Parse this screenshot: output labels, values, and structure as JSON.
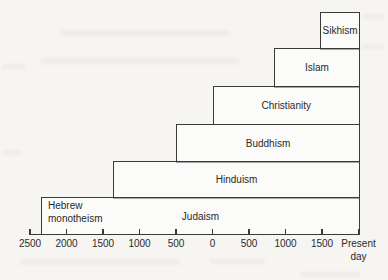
{
  "chart_data": {
    "type": "bar",
    "subtype": "staircase-timeline",
    "title": "",
    "xlabel": "",
    "ylabel": "",
    "x_axis": {
      "range_years": [
        -2500,
        2000
      ],
      "note": "negative years = BCE; axis numbers shown without era labels; right end marked Present day",
      "ticks": [
        {
          "year": -2500,
          "label": "2500"
        },
        {
          "year": -2000,
          "label": "2000"
        },
        {
          "year": -1500,
          "label": "1500"
        },
        {
          "year": -1000,
          "label": "1000"
        },
        {
          "year": -500,
          "label": "500"
        },
        {
          "year": 0,
          "label": "0"
        },
        {
          "year": 500,
          "label": "500"
        },
        {
          "year": 1000,
          "label": "1000"
        },
        {
          "year": 1500,
          "label": "1500"
        },
        {
          "year": 2000,
          "label": "Present day"
        }
      ]
    },
    "series": [
      {
        "label": "Sikhism",
        "start_year": 1475,
        "end": "present"
      },
      {
        "label": "Islam",
        "start_year": 840,
        "end": "present"
      },
      {
        "label": "Christianity",
        "start_year": 0,
        "end": "present"
      },
      {
        "label": "Buddhism",
        "start_year": -500,
        "end": "present"
      },
      {
        "label": "Hinduism",
        "start_year": -1360,
        "end": "present"
      },
      {
        "label": "Judaism",
        "start_year": -2350,
        "end": "present",
        "annotation": "Hebrew monotheism"
      }
    ],
    "colors": {
      "line": "#3a3a3a",
      "text": "#2a2a2a",
      "paper": "#f6f5f2"
    }
  }
}
